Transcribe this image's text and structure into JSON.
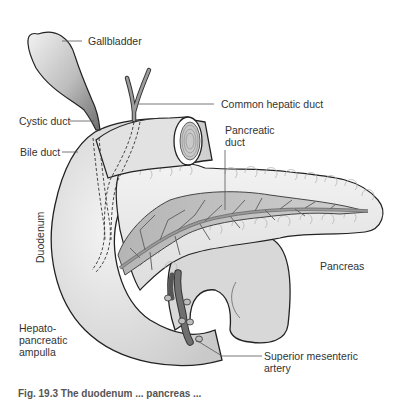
{
  "figure": {
    "labels": {
      "gallbladder": "Gallbladder",
      "common_hepatic_duct": "Common hepatic duct",
      "cystic_duct": "Cystic duct",
      "pancreatic_duct": "Pancreatic\nduct",
      "bile_duct": "Bile duct",
      "duodenum": "Duodenum",
      "pancreas": "Pancreas",
      "hepatopancreatic_ampulla": "Hepato-\npancreatic\nampulla",
      "superior_mesenteric_artery": "Superior mesenteric\nartery"
    },
    "caption": "Fig. 19.3 The duodenum ... pancreas ...",
    "colors": {
      "outline": "#222222",
      "duodenum_fill": "#dcdcdc",
      "pancreas_fill": "#eeeeee",
      "duct_fill": "#8a8a8a",
      "gallbladder_light": "#e8e8e8",
      "gallbladder_dark": "#777777",
      "leader_line": "#555555",
      "text": "#333333"
    }
  }
}
